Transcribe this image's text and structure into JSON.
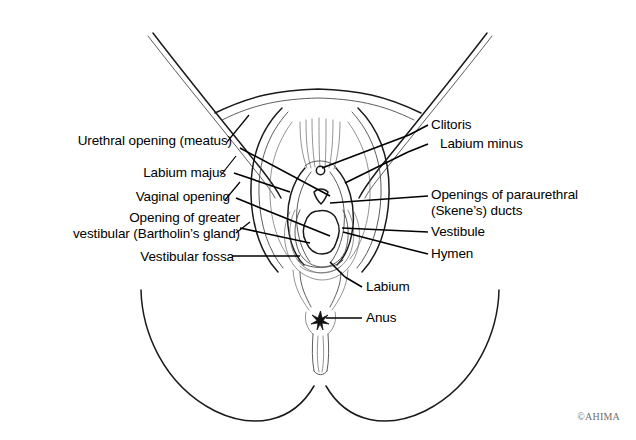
{
  "figure": {
    "view": "anterior perineal view",
    "background_color": "#ffffff",
    "line_color": "#1a1a1a",
    "text_color": "#000000"
  },
  "labels_left": [
    {
      "id": "urethral-opening",
      "text": "Urethral opening (meatus)",
      "lines": 1
    },
    {
      "id": "labium-majus",
      "text": "Labium majus",
      "lines": 1
    },
    {
      "id": "vaginal-opening",
      "text": "Vaginal opening",
      "lines": 1
    },
    {
      "id": "bartholin-gland",
      "text": "Opening of greater\nvestibular (Bartholin’s gland)",
      "lines": 2
    },
    {
      "id": "vestibular-fossa",
      "text": "Vestibular fossa",
      "lines": 1
    }
  ],
  "labels_right": [
    {
      "id": "clitoris",
      "text": "Clitoris",
      "lines": 1
    },
    {
      "id": "labium-minus",
      "text": "Labium minus",
      "lines": 1
    },
    {
      "id": "skene-ducts",
      "text": "Openings of paraurethral\n(Skene’s) ducts",
      "lines": 2
    },
    {
      "id": "vestibule",
      "text": "Vestibule",
      "lines": 1
    },
    {
      "id": "hymen",
      "text": "Hymen",
      "lines": 1
    },
    {
      "id": "labium",
      "text": "Labium",
      "lines": 1
    },
    {
      "id": "anus",
      "text": "Anus",
      "lines": 1
    }
  ],
  "credit": {
    "text": "©AHIMA"
  }
}
